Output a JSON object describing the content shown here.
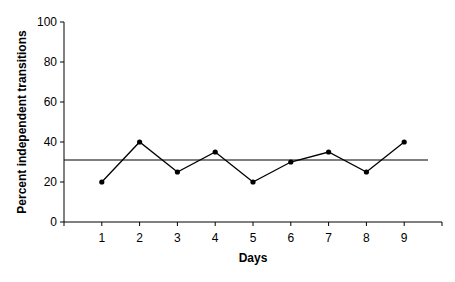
{
  "chart_data": {
    "type": "line",
    "title": "",
    "xlabel": "Days",
    "ylabel": "Percent independent transitions",
    "categories": [
      "1",
      "2",
      "3",
      "4",
      "5",
      "6",
      "7",
      "8",
      "9"
    ],
    "x": [
      1,
      2,
      3,
      4,
      5,
      6,
      7,
      8,
      9
    ],
    "series": [
      {
        "name": "Percent independent transitions",
        "values": [
          20,
          40,
          25,
          35,
          20,
          30,
          35,
          25,
          40
        ],
        "marker": "circle",
        "color": "#000000"
      }
    ],
    "reference_lines": [
      {
        "type": "horizontal",
        "value": 31,
        "label": "mean",
        "color": "#000000"
      }
    ],
    "ylim": [
      0,
      100
    ],
    "xlim": [
      0,
      10
    ],
    "yticks": [
      0,
      20,
      40,
      60,
      80,
      100
    ],
    "xticks": [
      1,
      2,
      3,
      4,
      5,
      6,
      7,
      8,
      9
    ],
    "grid": false,
    "legend": null
  }
}
